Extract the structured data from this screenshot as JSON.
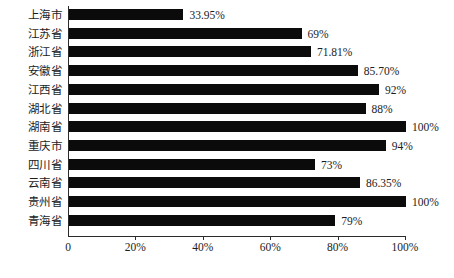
{
  "chart_data": {
    "type": "bar",
    "orientation": "horizontal",
    "title": "",
    "subtitle": "",
    "xlabel": "",
    "ylabel": "",
    "xlim": [
      0,
      100
    ],
    "grid": false,
    "legend": null,
    "bar_color": "#0b0b0b",
    "axis_color": "#2b2b2b",
    "background_color": "#ffffff",
    "categories": [
      "上海市",
      "江苏省",
      "浙江省",
      "安徽省",
      "江西省",
      "湖北省",
      "湖南省",
      "重庆市",
      "四川省",
      "云南省",
      "贵州省",
      "青海省"
    ],
    "values": [
      33.95,
      69,
      71.81,
      85.7,
      92,
      88,
      100,
      94,
      73,
      86.35,
      100,
      79
    ],
    "data_labels": [
      "33.95%",
      "69%",
      "71.81%",
      "85.70%",
      "92%",
      "88%",
      "100%",
      "94%",
      "73%",
      "86.35%",
      "100%",
      "79%"
    ],
    "xticks": [
      0,
      20,
      40,
      60,
      80,
      100
    ],
    "xtick_labels": [
      "0",
      "20%",
      "40%",
      "60%",
      "80%",
      "100%"
    ]
  }
}
